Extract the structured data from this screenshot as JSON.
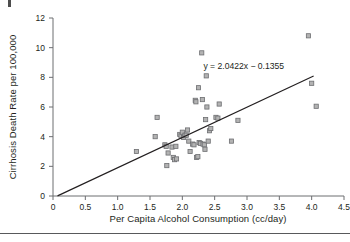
{
  "figure": {
    "background": "#ffffff",
    "marker_fill": "#b3b3b3",
    "marker_stroke": "#6d6e71",
    "line_color": "#231f20",
    "axis_color": "#6d6e71",
    "rule_color": "#58595b"
  },
  "chart_data": {
    "type": "scatter",
    "title": "",
    "subtitle": "",
    "xlabel": "Per Capita Alcohol Consumption (cc/day)",
    "ylabel": "Cirrhosis Death Rate per 100,000",
    "xlim": [
      0,
      4.5
    ],
    "ylim": [
      0,
      12
    ],
    "xticks": [
      "0",
      "0.5",
      "1.0",
      "1.5",
      "2.0",
      "2.5",
      "3.0",
      "3.5",
      "4.0",
      "4.5"
    ],
    "xtick_values": [
      0,
      0.5,
      1.0,
      1.5,
      2.0,
      2.5,
      3.0,
      3.5,
      4.0,
      4.5
    ],
    "yticks": [
      "0",
      "2",
      "4",
      "6",
      "8",
      "10",
      "12"
    ],
    "ytick_values": [
      0,
      2,
      4,
      6,
      8,
      10,
      12
    ],
    "grid": false,
    "legend": null,
    "annotations": [
      {
        "text": "y = 2.0422x − 0.1355",
        "x": 2.95,
        "y": 8.55
      }
    ],
    "trendline": {
      "type": "linear",
      "equation": "y = 2.0422x − 0.1355",
      "slope": 2.0422,
      "intercept": -0.1355,
      "x_start": 0.07,
      "x_end": 4.03
    },
    "series": [
      {
        "name": "Countries",
        "marker": "square",
        "points": [
          [
            1.29,
            3.0
          ],
          [
            1.58,
            4.0
          ],
          [
            1.61,
            5.3
          ],
          [
            1.73,
            3.45
          ],
          [
            1.75,
            3.35
          ],
          [
            1.76,
            2.05
          ],
          [
            1.78,
            2.9
          ],
          [
            1.84,
            3.3
          ],
          [
            1.86,
            2.6
          ],
          [
            1.88,
            2.45
          ],
          [
            1.9,
            3.35
          ],
          [
            1.91,
            2.5
          ],
          [
            1.96,
            4.15
          ],
          [
            1.98,
            4.05
          ],
          [
            2.0,
            4.3
          ],
          [
            2.02,
            3.95
          ],
          [
            2.04,
            4.1
          ],
          [
            2.06,
            4.1
          ],
          [
            2.08,
            4.45
          ],
          [
            2.1,
            3.7
          ],
          [
            2.12,
            3.0
          ],
          [
            2.16,
            3.5
          ],
          [
            2.18,
            3.45
          ],
          [
            2.2,
            6.45
          ],
          [
            2.21,
            6.35
          ],
          [
            2.22,
            2.6
          ],
          [
            2.24,
            2.65
          ],
          [
            2.25,
            7.3
          ],
          [
            2.26,
            3.6
          ],
          [
            2.28,
            3.55
          ],
          [
            2.3,
            9.65
          ],
          [
            2.31,
            6.5
          ],
          [
            2.32,
            3.5
          ],
          [
            2.34,
            3.45
          ],
          [
            2.35,
            3.15
          ],
          [
            2.36,
            5.15
          ],
          [
            2.37,
            8.1
          ],
          [
            2.38,
            6.0
          ],
          [
            2.4,
            3.7
          ],
          [
            2.42,
            4.4
          ],
          [
            2.44,
            4.55
          ],
          [
            2.52,
            5.3
          ],
          [
            2.55,
            5.25
          ],
          [
            2.57,
            6.2
          ],
          [
            2.76,
            3.7
          ],
          [
            2.86,
            5.1
          ],
          [
            3.95,
            10.8
          ],
          [
            4.0,
            7.6
          ],
          [
            4.07,
            6.05
          ]
        ]
      }
    ]
  }
}
